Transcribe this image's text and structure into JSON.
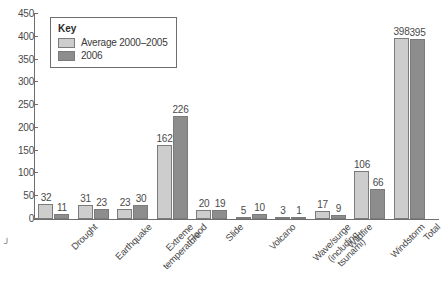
{
  "legend": {
    "title": "Key",
    "entries": [
      {
        "label": "Average 2000–2005",
        "color": "#cdcdcd",
        "name": "legend-swatch-average"
      },
      {
        "label": "2006",
        "color": "#8d8d8d",
        "name": "legend-swatch-2006"
      }
    ]
  },
  "colors": {
    "series_average": "#cdcdcd",
    "series_2006": "#8d8d8d",
    "axis": "#6e6e6e",
    "text": "#4a4a4a",
    "background": "#ffffff"
  },
  "chart_data": {
    "type": "bar",
    "title": "",
    "subtitle": "",
    "xlabel": "",
    "ylabel": "",
    "ylim": [
      0,
      450
    ],
    "yticks": [
      0,
      50,
      100,
      150,
      200,
      250,
      300,
      350,
      400,
      450
    ],
    "grid": false,
    "legend_position": "top-left",
    "categories": [
      "Drought",
      "Earthquake",
      "Extreme\ntemperature",
      "Flood",
      "Slide",
      "Volcano",
      "Wave/surge\n(including\ntsunami)",
      "Wildfire",
      "Windstorm",
      "Total"
    ],
    "series": [
      {
        "name": "Average 2000–2005",
        "color": "#cdcdcd",
        "values": [
          32,
          31,
          23,
          162,
          20,
          5,
          3,
          17,
          106,
          398
        ]
      },
      {
        "name": "2006",
        "color": "#8d8d8d",
        "values": [
          11,
          23,
          30,
          226,
          19,
          10,
          1,
          9,
          66,
          395
        ]
      }
    ]
  }
}
